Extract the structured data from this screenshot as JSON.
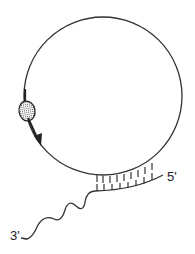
{
  "diagram": {
    "labels": {
      "five_prime": "5'",
      "three_prime": "3'"
    },
    "elements": {
      "circle": {
        "name": "circular-strand"
      },
      "enzyme": {
        "name": "hatched-oval-enzyme"
      },
      "arrow": {
        "name": "direction-arrow",
        "direction": "clockwise-down"
      },
      "duplex": {
        "name": "base-paired-region",
        "tick_count": 9
      },
      "tail": {
        "name": "wavy-3-prime-tail"
      }
    },
    "colors": {
      "stroke": "#333333",
      "background": "#ffffff"
    }
  }
}
